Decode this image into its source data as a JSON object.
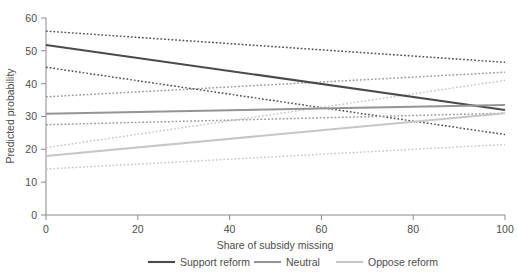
{
  "chart_data": {
    "type": "line",
    "title": "",
    "xlabel": "Share of subsidy missing",
    "ylabel": "Predicted probability",
    "xlim": [
      0,
      100
    ],
    "ylim": [
      0,
      60
    ],
    "xticks": [
      0,
      20,
      40,
      60,
      80,
      100
    ],
    "yticks": [
      0,
      10,
      20,
      30,
      40,
      50,
      60
    ],
    "xtick_labels": [
      "0",
      "20",
      "40",
      "60",
      "80",
      "100"
    ],
    "ytick_labels": [
      "0",
      "10",
      "20",
      "30",
      "40",
      "50",
      "60"
    ],
    "grid": false,
    "legend_position": "below",
    "x": [
      0,
      100
    ],
    "series": [
      {
        "name": "Support reform",
        "color": "#4a4a4a",
        "style": "solid",
        "values": [
          51.8,
          32.0
        ],
        "ci_upper": [
          56.0,
          46.5
        ],
        "ci_lower": [
          45.0,
          24.5
        ]
      },
      {
        "name": "Neutral",
        "color": "#949494",
        "style": "solid",
        "values": [
          30.8,
          33.5
        ],
        "ci_upper": [
          36.0,
          43.5
        ],
        "ci_lower": [
          27.5,
          31.0
        ]
      },
      {
        "name": "Oppose reform",
        "color": "#c6c6c6",
        "style": "solid",
        "values": [
          18.0,
          31.0
        ],
        "ci_upper": [
          20.5,
          41.0
        ],
        "ci_lower": [
          14.0,
          21.5
        ]
      }
    ],
    "legend": [
      {
        "label": "Support reform",
        "color": "#4a4a4a"
      },
      {
        "label": "Neutral",
        "color": "#949494"
      },
      {
        "label": "Oppose reform",
        "color": "#c6c6c6"
      }
    ]
  }
}
